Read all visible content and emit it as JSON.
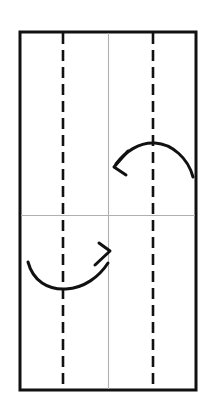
{
  "figure": {
    "kind": "origami-fold-diagram",
    "width": 214,
    "height": 418,
    "background_color": "#ffffff",
    "caption_fragment": "",
    "paper": {
      "name": "paper-sheet",
      "x": 20,
      "y": 32,
      "width": 176,
      "height": 358,
      "stroke_color": "#111111",
      "stroke_width": 3,
      "fill_color": "#ffffff"
    },
    "creases": [
      {
        "id": "valley-left",
        "type": "valley-dashed-vertical",
        "orientation": "vertical",
        "x": 63,
        "y1": 33,
        "y2": 389,
        "color": "#111111",
        "stroke_width": 2.6,
        "dash": "11 6"
      },
      {
        "id": "valley-right",
        "type": "valley-dashed-vertical",
        "orientation": "vertical",
        "x": 153,
        "y1": 33,
        "y2": 389,
        "color": "#111111",
        "stroke_width": 2.6,
        "dash": "11 6"
      },
      {
        "id": "existing-vertical-center",
        "type": "existing-crease-solid",
        "orientation": "vertical",
        "x": 108.5,
        "y1": 33,
        "y2": 389,
        "color": "#b0b0b0",
        "stroke_width": 1.1,
        "dash": "none"
      },
      {
        "id": "existing-horizontal-center",
        "type": "existing-crease-solid",
        "orientation": "horizontal",
        "x1": 21,
        "x2": 195,
        "y": 215.5,
        "color": "#b0b0b0",
        "stroke_width": 1.1,
        "dash": "none"
      }
    ],
    "arrows": [
      {
        "id": "fold-arrow-top-right",
        "name": "fold-arrow-upper",
        "direction": "right-to-left",
        "description": "arc over right valley crease, head points down-left",
        "color": "#111111",
        "stroke_width": 3,
        "path": "M 193 177 C 188 158 172 144 155 143 C 139 142 125 152 116 164",
        "head_path": "M 127 152 L 115 166 L 125 174 M 115 166 L 121 163",
        "tail_point": [
          193,
          177
        ],
        "head_point": [
          115,
          166
        ],
        "peak_point": [
          155,
          143
        ]
      },
      {
        "id": "fold-arrow-bottom-left",
        "name": "fold-arrow-lower",
        "direction": "left-to-right",
        "description": "arc under left valley crease, head points up-right",
        "color": "#111111",
        "stroke_width": 3,
        "path": "M 28 262 C 33 281 48 290 66 289 C 84 288 99 277 108 263",
        "head_path": "M 96 266 L 109 252 L 99 245 M 109 252 L 103 255",
        "tail_point": [
          28,
          262
        ],
        "head_point": [
          109,
          252
        ],
        "valley_point": [
          66,
          289
        ]
      }
    ]
  }
}
